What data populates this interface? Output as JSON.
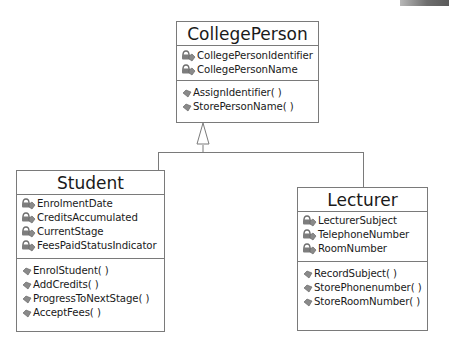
{
  "diagram": {
    "type": "UML class diagram",
    "relationship": "generalization",
    "classes": {
      "parent": {
        "name": "CollegePerson",
        "attributes": [
          "CollegePersonIdentifier",
          "CollegePersonName"
        ],
        "operations": [
          "AssignIdentifier( )",
          "StorePersonName( )"
        ]
      },
      "student": {
        "name": "Student",
        "attributes": [
          "EnrolmentDate",
          "CreditsAccumulated",
          "CurrentStage",
          "FeesPaidStatusIndicator"
        ],
        "operations": [
          "EnrolStudent( )",
          "AddCredits( )",
          "ProgressToNextStage( )",
          "AcceptFees( )"
        ]
      },
      "lecturer": {
        "name": "Lecturer",
        "attributes": [
          "LecturerSubject",
          "TelephoneNumber",
          "RoomNumber"
        ],
        "operations": [
          "RecordSubject( )",
          "StorePhonenumber( )",
          "StoreRoomNumber( )"
        ]
      }
    },
    "icons": {
      "attribute": "private-attribute-icon",
      "operation": "operation-icon"
    },
    "colors": {
      "border": "#7a7a7a",
      "text": "#1a1a1a",
      "icon": "#7d7d7d",
      "background": "#ffffff"
    }
  }
}
